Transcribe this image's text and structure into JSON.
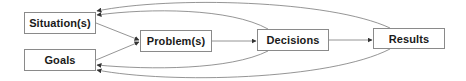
{
  "diagram": {
    "type": "flow",
    "nodes": [
      {
        "id": "situations",
        "label": "Situation(s)",
        "x": 24,
        "y": 12,
        "w": 72,
        "h": 22
      },
      {
        "id": "goals",
        "label": "Goals",
        "x": 24,
        "y": 49,
        "w": 72,
        "h": 22
      },
      {
        "id": "problems",
        "label": "Problem(s)",
        "x": 140,
        "y": 30,
        "w": 72,
        "h": 22
      },
      {
        "id": "decisions",
        "label": "Decisions",
        "x": 257,
        "y": 29,
        "w": 72,
        "h": 22
      },
      {
        "id": "results",
        "label": "Results",
        "x": 373,
        "y": 28,
        "w": 72,
        "h": 21
      }
    ],
    "edges": [
      {
        "from": "situations",
        "to": "problems"
      },
      {
        "from": "goals",
        "to": "problems"
      },
      {
        "from": "problems",
        "to": "decisions"
      },
      {
        "from": "decisions",
        "to": "results"
      },
      {
        "from": "decisions",
        "to": "situations"
      },
      {
        "from": "results",
        "to": "situations"
      },
      {
        "from": "decisions",
        "to": "goals"
      },
      {
        "from": "results",
        "to": "goals"
      }
    ],
    "colors": {
      "line": "#7a7a7a",
      "border": "#8a8a8a",
      "text": "#1a1a1a"
    }
  }
}
